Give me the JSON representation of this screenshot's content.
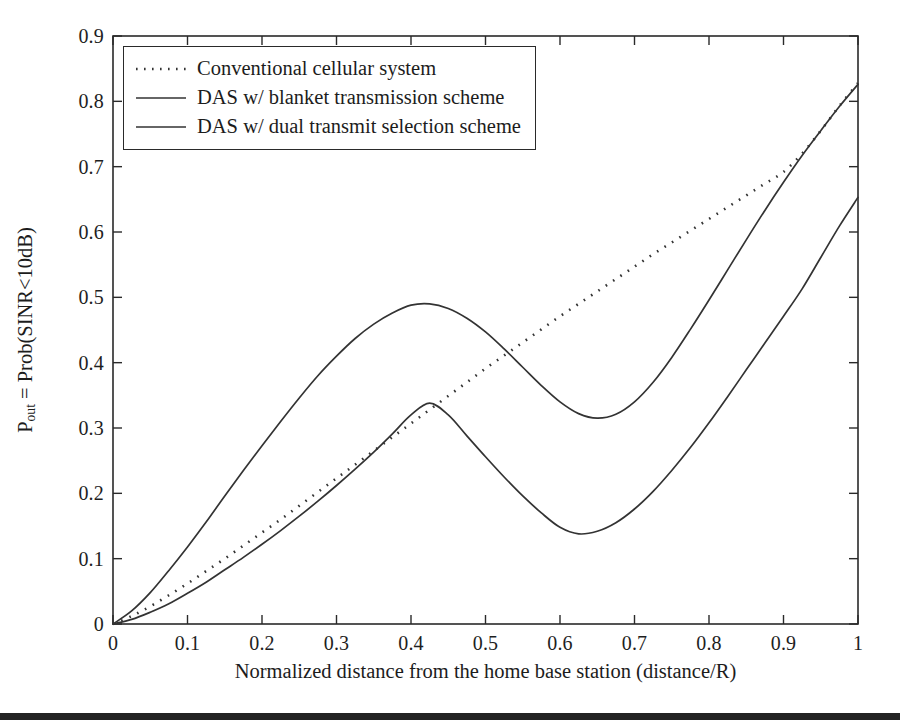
{
  "figure": {
    "background_color": "#ffffff",
    "axis_color": "#2a2a2a",
    "line_color": "#333333"
  },
  "axes": {
    "x_title": "Normalized distance from the home base station (distance/R)",
    "y_title_main": "P",
    "y_title_sub": "out",
    "y_title_rest": " = Prob(SINR<10dB)",
    "y_title_plain": "P_out = Prob(SINR<10dB)"
  },
  "legend": {
    "items": [
      {
        "label": "Conventional cellular system",
        "style": "dotted"
      },
      {
        "label": "DAS w/ blanket transmission scheme",
        "style": "solid"
      },
      {
        "label": "DAS w/ dual transmit selection scheme",
        "style": "solid"
      }
    ]
  },
  "chart_data": {
    "type": "line",
    "title": "",
    "xlabel": "Normalized distance from the home base station (distance/R)",
    "ylabel": "P_out = Prob(SINR<10dB)",
    "xlim": [
      0,
      1
    ],
    "ylim": [
      0,
      0.9
    ],
    "grid": false,
    "legend_position": "top-left",
    "xticks": [
      "0",
      "0.1",
      "0.2",
      "0.3",
      "0.4",
      "0.5",
      "0.6",
      "0.7",
      "0.8",
      "0.9",
      "1"
    ],
    "xtick_values": [
      0,
      0.1,
      0.2,
      0.3,
      0.4,
      0.5,
      0.6,
      0.7,
      0.8,
      0.9,
      1
    ],
    "yticks": [
      "0",
      "0.1",
      "0.2",
      "0.3",
      "0.4",
      "0.5",
      "0.6",
      "0.7",
      "0.8",
      "0.9"
    ],
    "ytick_values": [
      0,
      0.1,
      0.2,
      0.3,
      0.4,
      0.5,
      0.6,
      0.7,
      0.8,
      0.9
    ],
    "x": [
      0,
      0.025,
      0.05,
      0.075,
      0.1,
      0.125,
      0.15,
      0.175,
      0.2,
      0.225,
      0.25,
      0.275,
      0.3,
      0.325,
      0.35,
      0.375,
      0.4,
      0.425,
      0.45,
      0.475,
      0.5,
      0.525,
      0.55,
      0.575,
      0.6,
      0.625,
      0.65,
      0.675,
      0.7,
      0.725,
      0.75,
      0.775,
      0.8,
      0.825,
      0.85,
      0.875,
      0.9,
      0.925,
      0.95,
      0.975,
      1
    ],
    "series": [
      {
        "name": "Conventional cellular system",
        "style": "dotted",
        "values": [
          0.0,
          0.012,
          0.027,
          0.044,
          0.062,
          0.081,
          0.1,
          0.12,
          0.14,
          0.16,
          0.181,
          0.202,
          0.223,
          0.244,
          0.265,
          0.286,
          0.307,
          0.328,
          0.349,
          0.37,
          0.391,
          0.411,
          0.431,
          0.451,
          0.471,
          0.49,
          0.509,
          0.528,
          0.547,
          0.566,
          0.584,
          0.602,
          0.62,
          0.638,
          0.656,
          0.674,
          0.692,
          0.72,
          0.755,
          0.793,
          0.828
        ]
      },
      {
        "name": "DAS w/ blanket transmission scheme",
        "style": "solid",
        "values": [
          0.0,
          0.02,
          0.048,
          0.082,
          0.118,
          0.156,
          0.196,
          0.235,
          0.273,
          0.31,
          0.346,
          0.38,
          0.41,
          0.437,
          0.459,
          0.476,
          0.488,
          0.49,
          0.483,
          0.468,
          0.447,
          0.421,
          0.393,
          0.365,
          0.34,
          0.322,
          0.315,
          0.321,
          0.34,
          0.37,
          0.408,
          0.451,
          0.496,
          0.542,
          0.588,
          0.633,
          0.676,
          0.717,
          0.755,
          0.792,
          0.826
        ]
      },
      {
        "name": "DAS w/ dual transmit selection scheme",
        "style": "solid",
        "values": [
          0.0,
          0.007,
          0.018,
          0.031,
          0.047,
          0.064,
          0.083,
          0.102,
          0.122,
          0.143,
          0.165,
          0.188,
          0.212,
          0.237,
          0.263,
          0.291,
          0.32,
          0.338,
          0.32,
          0.288,
          0.256,
          0.225,
          0.196,
          0.17,
          0.148,
          0.138,
          0.142,
          0.155,
          0.176,
          0.203,
          0.235,
          0.27,
          0.308,
          0.348,
          0.389,
          0.43,
          0.471,
          0.513,
          0.561,
          0.609,
          0.653
        ]
      }
    ]
  }
}
